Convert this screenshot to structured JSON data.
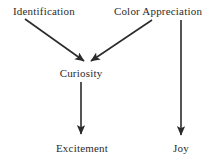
{
  "diagram": {
    "background_color": "#ffffff",
    "stroke_color": "#2b2b2b",
    "text_color": "#2b2b2b",
    "nodes": [
      {
        "id": "identification",
        "label": "Identification",
        "x": 44,
        "y": 11
      },
      {
        "id": "color_appreciation",
        "label": "Color Appreciation",
        "x": 158,
        "y": 11
      },
      {
        "id": "curiosity",
        "label": "Curiosity",
        "x": 81,
        "y": 73
      },
      {
        "id": "excitement",
        "label": "Excitement",
        "x": 82,
        "y": 148
      },
      {
        "id": "joy",
        "label": "Joy",
        "x": 181,
        "y": 148
      }
    ],
    "edges": [
      {
        "id": "identification-to-curiosity",
        "from": "identification",
        "to": "curiosity",
        "x1": 25,
        "y1": 19,
        "x2": 85,
        "y2": 62,
        "arrowhead": "end"
      },
      {
        "id": "color-appreciation-to-curiosity",
        "from": "color_appreciation",
        "to": "curiosity",
        "x1": 152,
        "y1": 20,
        "x2": 90,
        "y2": 62,
        "arrowhead": "end"
      },
      {
        "id": "curiosity-to-excitement",
        "from": "curiosity",
        "to": "excitement",
        "x1": 81,
        "y1": 82,
        "x2": 81,
        "y2": 136,
        "arrowhead": "end"
      },
      {
        "id": "color-appreciation-to-joy",
        "from": "color_appreciation",
        "to": "joy",
        "x1": 181,
        "y1": 20,
        "x2": 181,
        "y2": 137,
        "arrowhead": "end"
      }
    ]
  }
}
